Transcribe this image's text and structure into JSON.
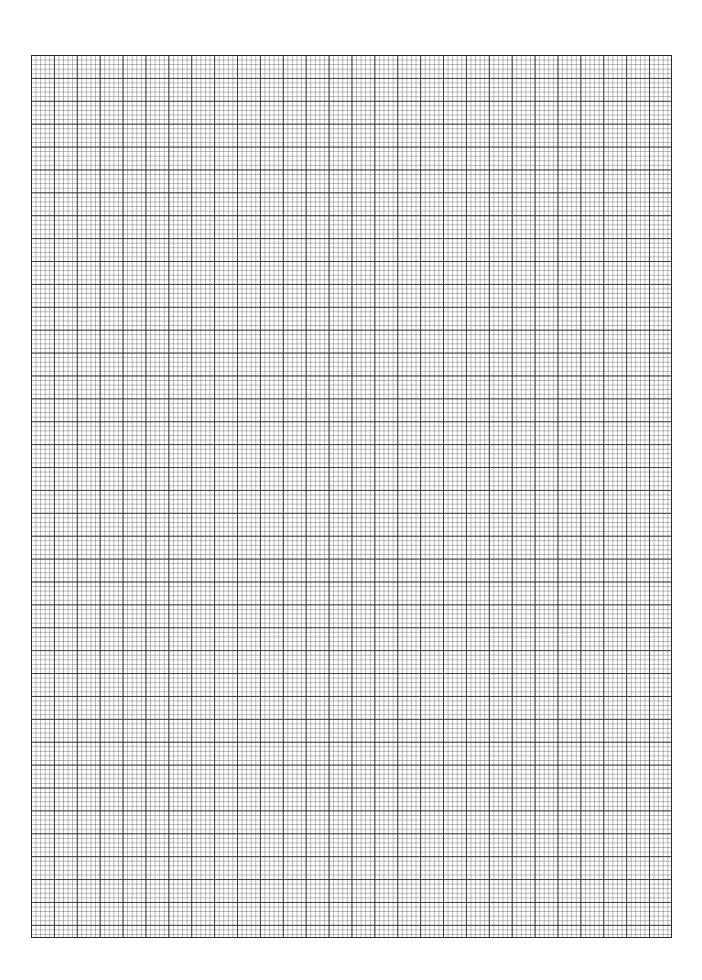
{
  "document": {
    "type": "graph paper",
    "grid": {
      "major_cell_px": 22.9,
      "minor_divisions_per_major": 5,
      "columns_major": 28,
      "rows_major": 38.5,
      "line_color": "#2a2a2a",
      "background": "#ffffff"
    }
  }
}
